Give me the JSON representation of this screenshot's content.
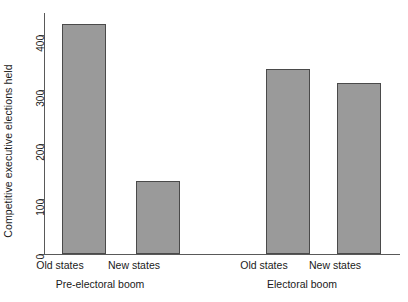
{
  "chart_data": {
    "type": "bar",
    "title": "",
    "xlabel": "",
    "ylabel": "Competitive executive elections held",
    "ylim": [
      0,
      440
    ],
    "yticks": [
      0,
      100,
      200,
      300,
      400
    ],
    "ytick_labels": [
      "0",
      "100",
      "200",
      "300",
      "400"
    ],
    "grid": false,
    "legend": "none",
    "categories": [
      "Old states",
      "New states",
      "Old states",
      "New states"
    ],
    "values": [
      420,
      133,
      338,
      312
    ],
    "groups": [
      {
        "label": "Pre-electoral boom",
        "categories": [
          "Old states",
          "New states"
        ],
        "values": [
          420,
          133
        ]
      },
      {
        "label": "Electoral boom",
        "categories": [
          "Old states",
          "New states"
        ],
        "values": [
          338,
          312
        ]
      }
    ],
    "bar_color": "#9a9a9a",
    "bar_edge_color": "#4a4a4a",
    "axis_color": "#595959",
    "background": "#ffffff"
  }
}
